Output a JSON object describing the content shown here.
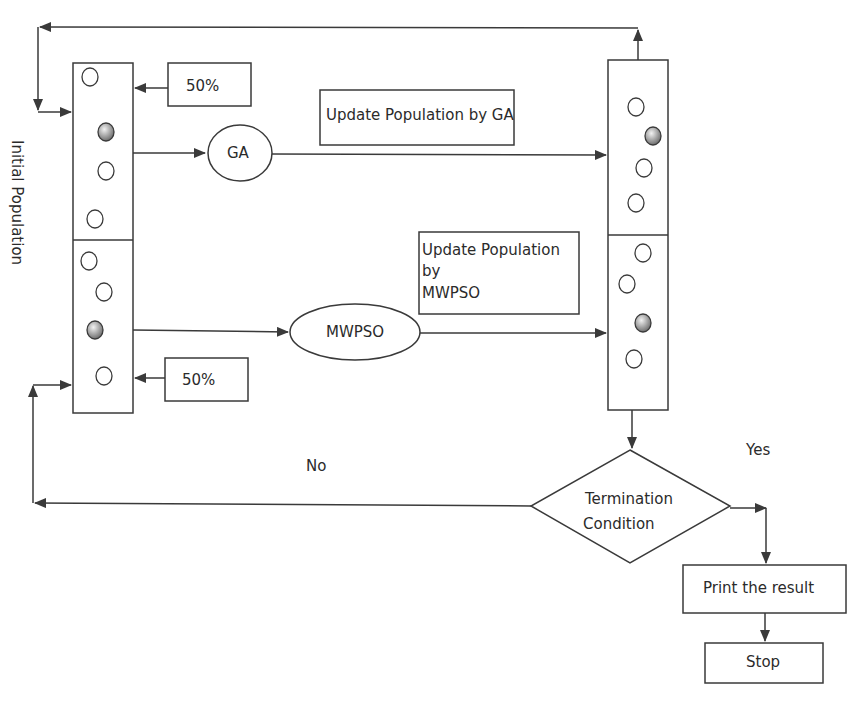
{
  "diagram": {
    "type": "flowchart",
    "labels": {
      "initial_population": "Initial Population",
      "ga_share": "50%",
      "mwpso_share": "50%",
      "ga_node": "GA",
      "mwpso_node": "MWPSO",
      "update_ga": "Update Population by GA",
      "update_mwpso_line1": "Update Population",
      "update_mwpso_line2": "by",
      "update_mwpso_line3": "MWPSO",
      "termination_line1": "Termination",
      "termination_line2": "Condition",
      "yes": "Yes",
      "no": "No",
      "print_result": "Print the result",
      "stop": "Stop"
    },
    "colors": {
      "stroke": "#3a3a3a",
      "text": "#2b2b2b",
      "particle_fill_shaded": "#8a8a8a",
      "background": "#ffffff"
    },
    "nodes": [
      {
        "id": "initial-population",
        "shape": "split-rectangle",
        "halves": [
          "GA subpopulation",
          "MWPSO subpopulation"
        ]
      },
      {
        "id": "ga",
        "shape": "ellipse"
      },
      {
        "id": "mwpso",
        "shape": "ellipse"
      },
      {
        "id": "updated-population",
        "shape": "split-rectangle"
      },
      {
        "id": "termination",
        "shape": "diamond"
      },
      {
        "id": "print",
        "shape": "rectangle"
      },
      {
        "id": "stop",
        "shape": "rectangle"
      }
    ],
    "edges": [
      {
        "from": "initial-population.top",
        "to": "ga"
      },
      {
        "from": "ga",
        "to": "updated-population.top",
        "label": "Update Population by GA"
      },
      {
        "from": "initial-population.bottom",
        "to": "mwpso"
      },
      {
        "from": "mwpso",
        "to": "updated-population.bottom",
        "label": "Update Population by MWPSO"
      },
      {
        "from": "updated-population",
        "to": "termination"
      },
      {
        "from": "termination",
        "to": "initial-population",
        "label": "No"
      },
      {
        "from": "termination",
        "to": "print",
        "label": "Yes"
      },
      {
        "from": "print",
        "to": "stop"
      },
      {
        "from": "updated-population",
        "to": "initial-population",
        "label": "feedback loop"
      }
    ]
  }
}
